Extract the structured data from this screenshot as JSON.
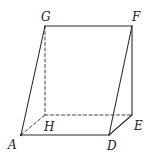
{
  "diagram": {
    "type": "triangular-prism",
    "vertices": {
      "A": {
        "x": 21,
        "y": 135,
        "label": "A",
        "lx": 8,
        "ly": 149
      },
      "D": {
        "x": 109,
        "y": 135,
        "label": "D",
        "lx": 107,
        "ly": 150
      },
      "E": {
        "x": 132,
        "y": 115,
        "label": "E",
        "lx": 134,
        "ly": 130
      },
      "H": {
        "x": 45,
        "y": 115,
        "label": "H",
        "lx": 44,
        "ly": 131
      },
      "G": {
        "x": 45,
        "y": 26,
        "label": "G",
        "lx": 41,
        "ly": 21
      },
      "F": {
        "x": 132,
        "y": 26,
        "label": "F",
        "lx": 132,
        "ly": 21
      }
    },
    "edges_solid": [
      [
        "G",
        "F"
      ],
      [
        "G",
        "A"
      ],
      [
        "F",
        "E"
      ],
      [
        "F",
        "D"
      ],
      [
        "A",
        "D"
      ],
      [
        "D",
        "E"
      ]
    ],
    "edges_hidden": [
      [
        "G",
        "H"
      ],
      [
        "H",
        "E"
      ],
      [
        "A",
        "H"
      ]
    ],
    "stroke_color": "#2b2b2b"
  }
}
